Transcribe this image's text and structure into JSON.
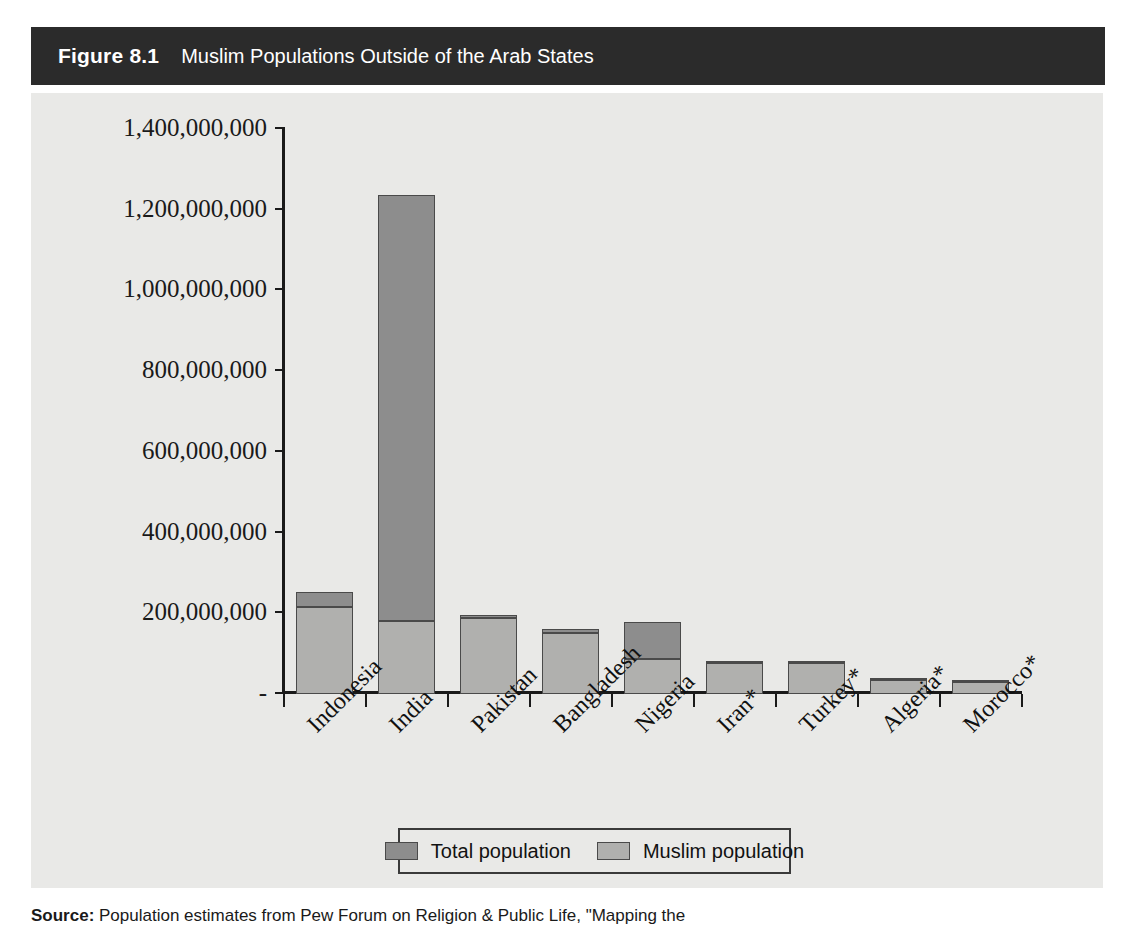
{
  "figure": {
    "number": "Figure 8.1",
    "caption": "Muslim Populations Outside of the Arab States"
  },
  "source_note": {
    "label": "Source:",
    "text": " Population estimates from Pew Forum on Religion & Public Life, \"Mapping the"
  },
  "legend": {
    "position": "bottom-center",
    "entries": [
      {
        "label": "Total population",
        "color": "#8d8d8d"
      },
      {
        "label": "Muslim population",
        "color": "#b0b0ae"
      }
    ]
  },
  "axis": {
    "y_ticks": [
      {
        "label": "1,400,000,000",
        "value": 1400000000
      },
      {
        "label": "1,200,000,000",
        "value": 1200000000
      },
      {
        "label": "1,000,000,000",
        "value": 1000000000
      },
      {
        "label": "800,000,000",
        "value": 800000000
      },
      {
        "label": "600,000,000",
        "value": 600000000
      },
      {
        "label": "400,000,000",
        "value": 400000000
      },
      {
        "label": "200,000,000",
        "value": 200000000
      },
      {
        "label": "-",
        "value": 0
      }
    ]
  },
  "chart_data": {
    "type": "bar",
    "title": "Muslim Populations Outside of the Arab States",
    "xlabel": "",
    "ylabel": "",
    "ylim": [
      0,
      1400000000
    ],
    "grid": false,
    "legend_position": "bottom-center",
    "stacked": true,
    "categories": [
      "Indonesia",
      "India",
      "Pakistan",
      "Bangladesh",
      "Nigeria",
      "Iran*",
      "Turkey*",
      "Algeria*",
      "Morocco*"
    ],
    "series": [
      {
        "name": "Total population",
        "color": "#8d8d8d",
        "values": [
          253000000,
          1236000000,
          195000000,
          161000000,
          179000000,
          78000000,
          80000000,
          36000000,
          31000000
        ]
      },
      {
        "name": "Muslim population",
        "color": "#b0b0ae",
        "values": [
          216000000,
          181000000,
          188000000,
          150000000,
          87000000,
          76000000,
          76000000,
          35000000,
          30000000
        ]
      }
    ]
  }
}
